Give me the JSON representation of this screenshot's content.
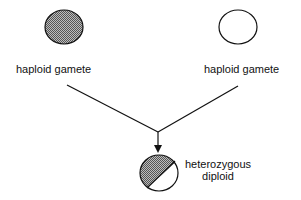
{
  "diagram": {
    "gametes": [
      {
        "id": "left",
        "label": "haploid gamete",
        "fill": "hatched-gray"
      },
      {
        "id": "right",
        "label": "haploid gamete",
        "fill": "white"
      }
    ],
    "result": {
      "label_line1": "heterozygous",
      "label_line2": "diploid",
      "fill": "half-hatched"
    },
    "colors": {
      "stroke": "#111111",
      "hatch": "#8a8a8a",
      "background": "#ffffff"
    }
  }
}
